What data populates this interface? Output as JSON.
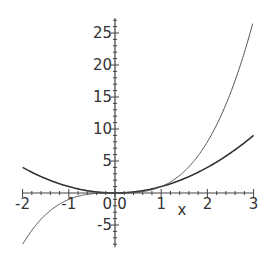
{
  "chart_data": {
    "type": "line",
    "title": "",
    "xlabel": "x",
    "ylabel": "",
    "xlim": [
      -2,
      3
    ],
    "ylim": [
      -8,
      27
    ],
    "x_ticks": [
      -2,
      -1,
      0,
      1,
      2,
      3
    ],
    "y_ticks": [
      -5,
      0,
      5,
      10,
      15,
      20,
      25
    ],
    "x_tick_labels": [
      "-2",
      "-1",
      "0",
      "1",
      "2",
      "3"
    ],
    "y_tick_labels": [
      "-5",
      "0",
      "5",
      "10",
      "15",
      "20",
      "25"
    ],
    "grid": false,
    "legend": null,
    "series": [
      {
        "name": "x^2",
        "style": "solid",
        "x": [
          -2,
          -1.5,
          -1,
          -0.5,
          0,
          0.5,
          1,
          1.5,
          2,
          2.5,
          3
        ],
        "values": [
          4,
          2.25,
          1,
          0.25,
          0,
          0.25,
          1,
          2.25,
          4,
          6.25,
          9
        ]
      },
      {
        "name": "x^3",
        "style": "thin",
        "x": [
          -2,
          -1.5,
          -1,
          -0.5,
          0,
          0.5,
          1,
          1.5,
          2,
          2.5,
          3
        ],
        "values": [
          -8,
          -3.375,
          -1,
          -0.125,
          0,
          0.125,
          1,
          3.375,
          8,
          15.625,
          27
        ]
      }
    ]
  }
}
